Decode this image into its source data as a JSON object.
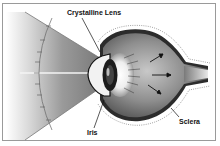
{
  "diagram": {
    "labels": {
      "lens": "Crystalline Lens",
      "iris": "Iris",
      "sclera": "Sclera"
    },
    "colors": {
      "frame": "#9a9a9a",
      "outline": "#111111",
      "light_cone": "#8c8c8c",
      "eyeball_mid": "#8a8a8a",
      "eyeball_dark": "#3c3c3c",
      "background": "#ffffff"
    },
    "icons": [
      "eye-diagram",
      "light-cone",
      "arrow-icon"
    ]
  }
}
